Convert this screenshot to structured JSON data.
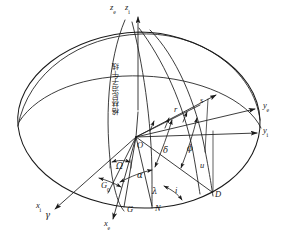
{
  "figure": {
    "background_color": "#ffffff",
    "line_color": "#1a1a1a",
    "meridian_label": "格林尼治子午线"
  },
  "axes": [
    {
      "id": "z-e",
      "label": "z",
      "sub": "e",
      "x": 112,
      "y": 4
    },
    {
      "id": "z-i",
      "label": "z",
      "sub": "i",
      "x": 127,
      "y": 4
    },
    {
      "id": "y-e",
      "label": "y",
      "sub": "e",
      "x": 264,
      "y": 106
    },
    {
      "id": "y-i",
      "label": "y",
      "sub": "i",
      "x": 264,
      "y": 131
    },
    {
      "id": "x-i",
      "label": "x",
      "sub": "i",
      "x": 40,
      "y": 205
    },
    {
      "id": "x-e",
      "label": "x",
      "sub": "e",
      "x": 108,
      "y": 223
    }
  ],
  "points": [
    {
      "id": "origin-O",
      "label": "O",
      "x": 139,
      "y": 141
    },
    {
      "id": "point-G0",
      "label": "G",
      "sub": "0",
      "x": 105,
      "y": 186
    },
    {
      "id": "point-G",
      "label": "G",
      "x": 124,
      "y": 209
    },
    {
      "id": "point-N",
      "label": "N",
      "x": 152,
      "y": 208
    },
    {
      "id": "point-D",
      "label": "D",
      "x": 216,
      "y": 193
    },
    {
      "id": "point-gamma",
      "label": "γ",
      "x": 48,
      "y": 215
    },
    {
      "id": "point-s",
      "label": "s",
      "x": 200,
      "y": 102
    },
    {
      "id": "point-r",
      "label": "r",
      "x": 175,
      "y": 110
    }
  ],
  "angles": [
    {
      "id": "angle-omega",
      "label": "Ω",
      "x": 119,
      "y": 166
    },
    {
      "id": "angle-alpha",
      "label": "α",
      "x": 140,
      "y": 175
    },
    {
      "id": "angle-delta",
      "label": "δ",
      "x": 166,
      "y": 150
    },
    {
      "id": "angle-phi",
      "label": "ϕ",
      "x": 190,
      "y": 148
    },
    {
      "id": "angle-u",
      "label": "u",
      "x": 202,
      "y": 165
    },
    {
      "id": "angle-lambda",
      "label": "λ",
      "x": 155,
      "y": 191
    },
    {
      "id": "angle-i",
      "label": "i",
      "x": 176,
      "y": 190
    }
  ],
  "geometry": {
    "sphere_center_x": 140,
    "sphere_center_y": 128,
    "sphere_rx": 122,
    "sphere_ry": 96,
    "origin_x": 136,
    "origin_y": 137
  }
}
